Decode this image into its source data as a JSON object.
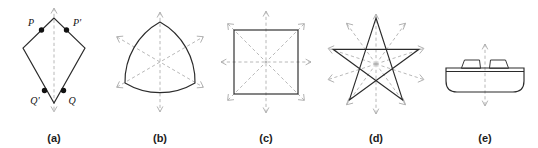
{
  "figure": {
    "kind": "symmetry-figure-plate",
    "background_color": "#ffffff",
    "solid_outline_color": "#2b2b2b",
    "mirror_line_color": "#b0b0b0",
    "vertex_dot_color": "#111111",
    "label_color": "#111111",
    "caption_color": "#1c1c1c"
  },
  "panels": [
    {
      "id": "panel-a",
      "caption": "(a)",
      "shape_name": "kite",
      "mirror_count": 1,
      "point_labels": [
        "P",
        "P'",
        "Q'",
        "Q"
      ],
      "vertex_dot_count": 4
    },
    {
      "id": "panel-b",
      "caption": "(b)",
      "shape_name": "reuleaux-triangle",
      "mirror_count": 3,
      "point_labels": [],
      "vertex_dot_count": 0
    },
    {
      "id": "panel-c",
      "caption": "(c)",
      "shape_name": "square",
      "mirror_count": 4,
      "point_labels": [],
      "vertex_dot_count": 0
    },
    {
      "id": "panel-d",
      "caption": "(d)",
      "shape_name": "pentagram-star",
      "mirror_count": 5,
      "point_labels": [],
      "vertex_dot_count": 0
    },
    {
      "id": "panel-e",
      "caption": "(e)",
      "shape_name": "boat-hull-profile",
      "mirror_count": 1,
      "point_labels": [],
      "vertex_dot_count": 0
    }
  ]
}
